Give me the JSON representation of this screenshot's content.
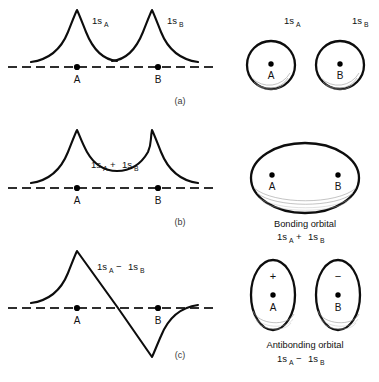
{
  "figure": {
    "title_text": "",
    "colors": {
      "ink": "#0d0d0d",
      "axis": "#2e2e2e",
      "shading": "#9a9a9a",
      "panel_label": "#3a3a3a"
    },
    "orbital_base": "1s",
    "nucleus_labels": {
      "a": "A",
      "b": "B"
    },
    "signs": {
      "plus": "+",
      "minus": "−"
    },
    "panels": [
      {
        "key": "a",
        "label": "(a)",
        "plot": {
          "type": "line",
          "description": "Two separate 1s atomic orbital wavefunctions centered on nuclei A and B, overlapping between the nuclei",
          "curves": [
            {
              "name": "1sA",
              "label_base": "1s",
              "label_sub": "A",
              "center": "A",
              "amplitude": 1.0,
              "sign": "+"
            },
            {
              "name": "1sB",
              "label_base": "1s",
              "label_sub": "B",
              "center": "B",
              "amplitude": 1.0,
              "sign": "+"
            }
          ],
          "axis": {
            "style": "dashed",
            "baseline": "zero amplitude"
          },
          "nuclei": [
            "A",
            "B"
          ]
        },
        "orbital": {
          "shape": "two-circles",
          "caption_line1": "",
          "caption_line2": "",
          "items": [
            {
              "label_base": "1s",
              "label_sub": "A",
              "nucleus": "A"
            },
            {
              "label_base": "1s",
              "label_sub": "B",
              "nucleus": "B"
            }
          ]
        }
      },
      {
        "key": "b",
        "label": "(b)",
        "plot": {
          "type": "line",
          "description": "In-phase sum of the two 1s orbitals giving constructive overlap between the nuclei",
          "expression": {
            "left_base": "1s",
            "left_sub": "A",
            "operator": "+",
            "right_base": "1s",
            "right_sub": "B"
          },
          "curves": [
            {
              "name": "1sA + 1sB",
              "amplitude": 1.0,
              "sign": "+"
            }
          ],
          "axis": {
            "style": "dashed",
            "baseline": "zero amplitude"
          },
          "nuclei": [
            "A",
            "B"
          ]
        },
        "orbital": {
          "shape": "single-ellipse",
          "caption_line1": "Bonding orbital",
          "caption_expression": {
            "left_base": "1s",
            "left_sub": "A",
            "operator": "+",
            "right_base": "1s",
            "right_sub": "B"
          },
          "items": [
            {
              "nucleus": "A"
            },
            {
              "nucleus": "B"
            }
          ]
        }
      },
      {
        "key": "c",
        "label": "(c)",
        "plot": {
          "type": "line",
          "description": "Out-of-phase difference of the two 1s orbitals with a node midway between the nuclei",
          "expression": {
            "left_base": "1s",
            "left_sub": "A",
            "operator": "−",
            "right_base": "1s",
            "right_sub": "B"
          },
          "curves": [
            {
              "name": "1sA − 1sB",
              "amplitude_positive": 1.0,
              "amplitude_negative": -1.0,
              "node": "midpoint between A and B"
            }
          ],
          "axis": {
            "style": "dashed",
            "baseline": "zero amplitude"
          },
          "nuclei": [
            "A",
            "B"
          ]
        },
        "orbital": {
          "shape": "two-ovals",
          "caption_line1": "Antibonding orbital",
          "caption_expression": {
            "left_base": "1s",
            "left_sub": "A",
            "operator": "−",
            "right_base": "1s",
            "right_sub": "B"
          },
          "items": [
            {
              "nucleus": "A",
              "sign": "+"
            },
            {
              "nucleus": "B",
              "sign": "−"
            }
          ]
        }
      }
    ]
  }
}
